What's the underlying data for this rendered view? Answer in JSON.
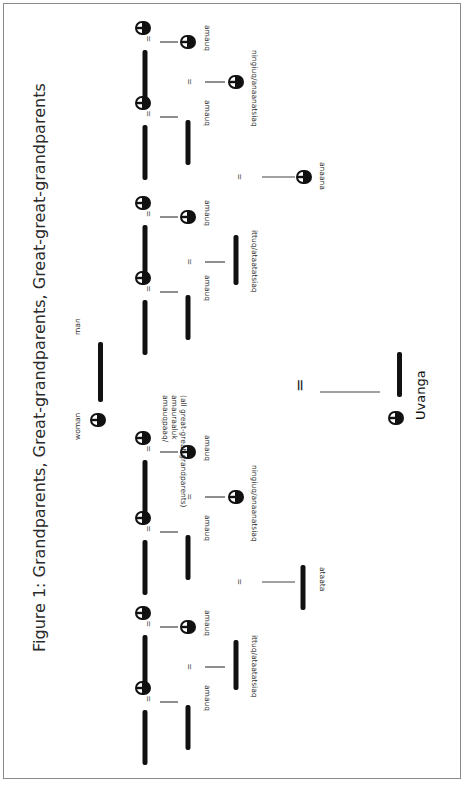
{
  "figure": {
    "title": "Figure 1: Grandparents, Great-grandparents, Great-great-grandparents",
    "legend": {
      "woman_label": "woman",
      "man_label": "man"
    },
    "great_great_grandparents_label": [
      "amauqpaaq/",
      "amauraaluk",
      "(all great-great-grandparents)"
    ],
    "ego_label": "Uvanga",
    "equals_symbol": "=",
    "labels": {
      "amauq": "amauq",
      "ningiuq": "ningiuq/anaanatsiaq",
      "ittuq": "ittuq/ataatatsiaq",
      "anaana": "anaana",
      "ataata": "ataata"
    },
    "great_grandparents": [
      {
        "sex": "woman",
        "label": "amauq"
      },
      {
        "sex": "man",
        "label": "amauq"
      },
      {
        "sex": "woman",
        "label": "amauq"
      },
      {
        "sex": "man",
        "label": "amauq"
      },
      {
        "sex": "woman",
        "label": "amauq"
      },
      {
        "sex": "man",
        "label": "amauq"
      },
      {
        "sex": "woman",
        "label": "amauq"
      },
      {
        "sex": "man",
        "label": "amauq"
      }
    ],
    "grandparents": [
      {
        "sex": "woman",
        "label": "ningiuq/anaanatsiaq"
      },
      {
        "sex": "man",
        "label": "ittuq/ataatatsiaq"
      },
      {
        "sex": "woman",
        "label": "ningiuq/anaanatsiaq"
      },
      {
        "sex": "man",
        "label": "ittuq/ataatatsiaq"
      }
    ],
    "parents": [
      {
        "sex": "woman",
        "label": "anaana"
      },
      {
        "sex": "man",
        "label": "ataata"
      }
    ]
  }
}
